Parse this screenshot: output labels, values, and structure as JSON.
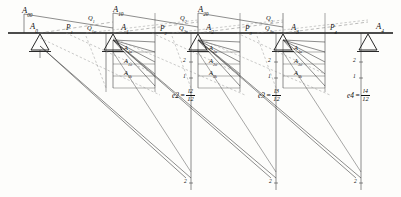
{
  "diagram": {
    "beam": {
      "y": 33,
      "x_start": 8,
      "x_end": 393,
      "color": "#111111"
    },
    "supports": [
      {
        "id": "s0",
        "label": "A",
        "sub": "0",
        "x": 40,
        "label_x": 30,
        "label_y": 22
      },
      {
        "id": "s1",
        "label": "A",
        "sub": "1",
        "x": 113,
        "label_x": 121,
        "label_y": 23
      },
      {
        "id": "s2",
        "label": "A",
        "sub": "2",
        "x": 198,
        "label_x": 206,
        "label_y": 23
      },
      {
        "id": "s3",
        "label": "A",
        "sub": "3",
        "x": 283,
        "label_x": 291,
        "label_y": 23
      },
      {
        "id": "s4",
        "label": "A",
        "sub": "4",
        "x": 368,
        "label_x": 376,
        "label_y": 22
      }
    ],
    "top_labels": [
      {
        "id": "t0",
        "label": "A",
        "sub": "00",
        "x": 22,
        "y": 6
      },
      {
        "id": "t1",
        "label": "A",
        "sub": "10",
        "x": 113,
        "y": 5
      },
      {
        "id": "t2",
        "label": "A",
        "sub": "20",
        "x": 198,
        "y": 5
      }
    ],
    "load_labels": [
      {
        "id": "p1",
        "label": "P",
        "sub": "1",
        "x": 66,
        "y": 24
      },
      {
        "id": "p2",
        "label": "P",
        "sub": "2",
        "x": 160,
        "y": 25
      },
      {
        "id": "p3",
        "label": "P",
        "sub": "3",
        "x": 245,
        "y": 25
      },
      {
        "id": "p4",
        "label": "P",
        "sub": "4",
        "x": 330,
        "y": 24
      }
    ],
    "q_labels": [
      {
        "id": "q1a",
        "label": "Q",
        "sub": "1",
        "x": 88,
        "y": 16
      },
      {
        "id": "q1b",
        "label": "Q",
        "sub": "1u",
        "x": 88,
        "y": 25
      },
      {
        "id": "q2a",
        "label": "Q",
        "sub": "2",
        "x": 180,
        "y": 16
      },
      {
        "id": "q2b",
        "label": "Q",
        "sub": "2u",
        "x": 180,
        "y": 25
      },
      {
        "id": "q3a",
        "label": "Q",
        "sub": "3",
        "x": 266,
        "y": 16
      },
      {
        "id": "q3b",
        "label": "Q",
        "sub": "3u",
        "x": 266,
        "y": 25
      }
    ],
    "stress_labels": [
      {
        "id": "a1u",
        "label": "A",
        "sub": "1u",
        "x": 124,
        "y": 45
      },
      {
        "id": "a1o",
        "label": "A",
        "sub": "1o",
        "x": 124,
        "y": 58
      },
      {
        "id": "a1k",
        "label": "A",
        "sub": "1k",
        "x": 124,
        "y": 70
      },
      {
        "id": "a2u",
        "label": "A",
        "sub": "2u",
        "x": 209,
        "y": 45
      },
      {
        "id": "a2o",
        "label": "A",
        "sub": "2o",
        "x": 209,
        "y": 58
      },
      {
        "id": "a2k",
        "label": "A",
        "sub": "2k",
        "x": 209,
        "y": 70
      },
      {
        "id": "a3u",
        "label": "A",
        "sub": "3u",
        "x": 294,
        "y": 45
      },
      {
        "id": "a3o",
        "label": "A",
        "sub": "3o",
        "x": 294,
        "y": 58
      },
      {
        "id": "a3k",
        "label": "A",
        "sub": "3k",
        "x": 294,
        "y": 70
      }
    ],
    "equations": [
      {
        "id": "e2",
        "lhs": "e",
        "lhs_sub": "2",
        "num": "l",
        "num_sub": "2",
        "den": "12",
        "x": 172,
        "y": 89
      },
      {
        "id": "e3",
        "lhs": "e",
        "lhs_sub": "3",
        "num": "l",
        "num_sub": "3",
        "den": "12",
        "x": 258,
        "y": 89
      },
      {
        "id": "e4",
        "lhs": "e",
        "lhs_sub": "4",
        "num": "l",
        "num_sub": "4",
        "den": "12",
        "x": 347,
        "y": 89
      }
    ],
    "tick_numbers": [
      {
        "id": "n1-2",
        "value": "2",
        "x": 191,
        "y": 60
      },
      {
        "id": "n1-1",
        "value": "1",
        "x": 191,
        "y": 76
      },
      {
        "id": "n2-2",
        "value": "2",
        "x": 276,
        "y": 60
      },
      {
        "id": "n2-1",
        "value": "1",
        "x": 276,
        "y": 76
      },
      {
        "id": "n3-2",
        "value": "2",
        "x": 361,
        "y": 60
      },
      {
        "id": "n3-1",
        "value": "1",
        "x": 361,
        "y": 76
      },
      {
        "id": "b1-2",
        "value": "2",
        "x": 189,
        "y": 181
      },
      {
        "id": "b2-2",
        "value": "2",
        "x": 274,
        "y": 181
      },
      {
        "id": "b3-2",
        "value": "2",
        "x": 359,
        "y": 181
      }
    ],
    "colors": {
      "ink": "#111111",
      "dashed": "#6b6b6b",
      "thin": "#3a3a3a",
      "paper": "#fdfdfb"
    }
  }
}
